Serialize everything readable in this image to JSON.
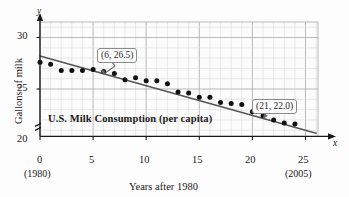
{
  "figure": {
    "title": "U.S. Milk Consumption (per capita)",
    "y_axis_title": "Gallons of milk",
    "x_axis_title": "Years after 1980",
    "x_axis_name": "x",
    "y_axis_name": "y",
    "start_year_label": "(1980)",
    "end_year_label": "(2005)",
    "axis_break_symbol": "break-mark"
  },
  "chart_data": {
    "type": "scatter",
    "title": "U.S. Milk Consumption (per capita)",
    "xlabel": "Years after 1980",
    "ylabel": "Gallons of milk",
    "xlim": [
      0,
      26.2
    ],
    "ylim": [
      20,
      31
    ],
    "y_axis_broken": true,
    "grid": true,
    "x_ticks": [
      0,
      5,
      10,
      15,
      20,
      25
    ],
    "x_tick_labels": [
      "0",
      "5",
      "10",
      "15",
      "20",
      "25"
    ],
    "y_ticks": [
      20,
      25,
      30
    ],
    "y_tick_labels": [
      "20",
      "25",
      "30"
    ],
    "x_minor_step": 1,
    "y_minor_step": 1,
    "series": [
      {
        "name": "U.S. milk consumption (gallons per capita)",
        "marker": "filled-circle",
        "color": "#111111",
        "x": [
          0,
          1,
          2,
          3,
          4,
          5,
          6,
          7,
          8,
          9,
          10,
          11,
          12,
          13,
          14,
          15,
          16,
          17,
          18,
          19,
          20,
          21,
          22,
          23,
          24
        ],
        "y": [
          27.6,
          27.4,
          26.8,
          26.8,
          26.8,
          26.9,
          26.7,
          26.5,
          25.9,
          26.1,
          25.8,
          25.8,
          25.5,
          24.7,
          24.6,
          24.2,
          24.2,
          23.7,
          23.6,
          23.5,
          22.8,
          22.4,
          22.0,
          21.7,
          21.6
        ]
      }
    ],
    "trend_line": {
      "name": "linear regression line",
      "color": "#555555",
      "points": [
        {
          "x": 0,
          "y": 28.2
        },
        {
          "x": 26.0,
          "y": 20.7
        }
      ]
    },
    "annotations": [
      {
        "label": "(6, 26.5)",
        "point_x": 6,
        "point_y": 26.5
      },
      {
        "label": "(21, 22.0)",
        "point_x": 21,
        "point_y": 22.0
      }
    ]
  }
}
